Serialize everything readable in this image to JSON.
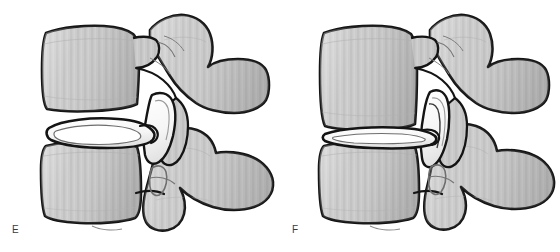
{
  "figure": {
    "type": "medical-illustration",
    "background_color": "#ffffff",
    "outline_color": "#141414",
    "bone_fill_color": "#c6c6c6",
    "bone_fill_light": "#d8d8d8",
    "bone_fill_shadow": "#a9a9a9",
    "cartilage_fill_color": "#fbfbfb",
    "label_color": "#3a3a3a"
  },
  "panels": [
    {
      "id": "E",
      "label": "E",
      "caption_letter": "E",
      "condition": "normal intervertebral disc height",
      "disc": {
        "name": "intervertebral-disc",
        "shape": "thick biconvex lens",
        "relative_height": "normal",
        "fill": "#fbfbfb"
      },
      "facet_joint": {
        "name": "zygapophyseal-facet-joint",
        "space": "open",
        "fill": "#fbfbfb"
      },
      "structures": [
        "superior vertebral body",
        "inferior vertebral body",
        "intervertebral disc",
        "superior articular process",
        "inferior articular process",
        "pedicle",
        "transverse process",
        "spinous process",
        "facet joint space",
        "intervertebral foramen"
      ]
    },
    {
      "id": "F",
      "label": "F",
      "caption_letter": "F",
      "condition": "degenerated collapsed intervertebral disc with narrowed disc space",
      "disc": {
        "name": "intervertebral-disc",
        "shape": "thin flattened sliver",
        "relative_height": "collapsed",
        "fill": "#fbfbfb"
      },
      "facet_joint": {
        "name": "zygapophyseal-facet-joint",
        "space": "narrowed / subluxed",
        "fill": "#fbfbfb"
      },
      "structures": [
        "superior vertebral body",
        "inferior vertebral body",
        "collapsed intervertebral disc",
        "superior articular process",
        "inferior articular process",
        "pedicle",
        "transverse process",
        "spinous process",
        "narrowed facet joint space",
        "narrowed intervertebral foramen"
      ]
    }
  ]
}
